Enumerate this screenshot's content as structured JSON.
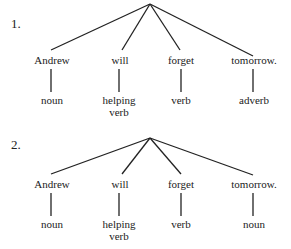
{
  "diagrams": [
    {
      "number": "1.",
      "words": [
        "Andrew",
        "will",
        "forget",
        "tomorrow."
      ],
      "labels": [
        "noun",
        "helping verb",
        "verb",
        "adverb"
      ],
      "labels_lines": [
        [
          "noun"
        ],
        [
          "helping",
          "verb"
        ],
        [
          "verb"
        ],
        [
          "adverb"
        ]
      ]
    },
    {
      "number": "2.",
      "words": [
        "Andrew",
        "will",
        "forget",
        "tomorrow."
      ],
      "labels": [
        "noun",
        "helping verb",
        "verb",
        "noun"
      ],
      "labels_lines": [
        [
          "noun"
        ],
        [
          "helping",
          "verb"
        ],
        [
          "verb"
        ],
        [
          "noun"
        ]
      ]
    }
  ],
  "colors": {
    "line": "#222222",
    "text": "#222222",
    "background": "#ffffff"
  }
}
